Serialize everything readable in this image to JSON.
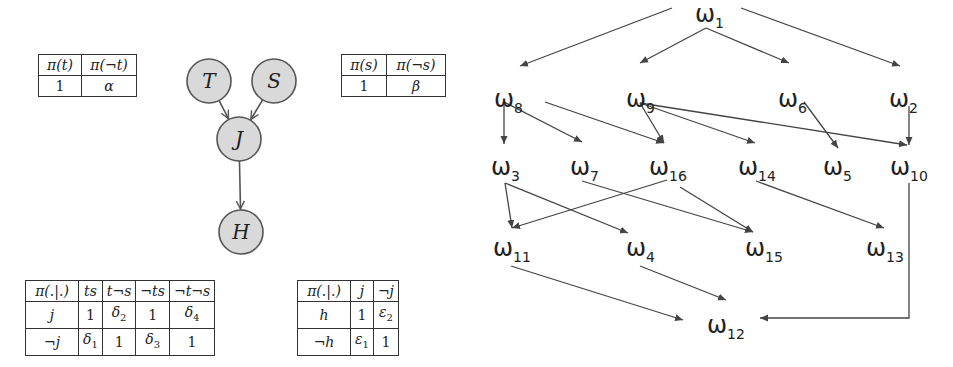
{
  "left_panel": {
    "network": {
      "nodes": [
        {
          "id": "T",
          "label": "T",
          "cx": 209,
          "cy": 81
        },
        {
          "id": "S",
          "label": "S",
          "cx": 274,
          "cy": 81
        },
        {
          "id": "J",
          "label": "J",
          "cx": 239,
          "cy": 139
        },
        {
          "id": "H",
          "label": "H",
          "cx": 241,
          "cy": 232
        }
      ],
      "edges": [
        {
          "from": "T",
          "to": "J"
        },
        {
          "from": "S",
          "to": "J"
        },
        {
          "from": "J",
          "to": "H"
        }
      ],
      "node_fill": "#d9d9d9",
      "node_stroke": "#555555"
    },
    "table_t": {
      "header": [
        "π(t)",
        "π(¬t)"
      ],
      "row": [
        "1",
        "α"
      ]
    },
    "table_s": {
      "header": [
        "π(s)",
        "π(¬s)"
      ],
      "row": [
        "1",
        "β"
      ]
    },
    "table_j": {
      "header": [
        "π(.|.)",
        "ts",
        "t¬s",
        "¬ts",
        "¬t¬s"
      ],
      "rows": [
        [
          "j",
          "1",
          "δ2",
          "1",
          "δ4"
        ],
        [
          "¬j",
          "δ1",
          "1",
          "δ3",
          "1"
        ]
      ]
    },
    "table_h": {
      "header": [
        "π(.|.)",
        "j",
        "¬j"
      ],
      "rows": [
        [
          "h",
          "1",
          "ε2"
        ],
        [
          "¬h",
          "ε1",
          "1"
        ]
      ]
    }
  },
  "right_panel": {
    "symbol": "ω",
    "nodes": [
      {
        "id": "1",
        "sub": "1",
        "x": 695,
        "y": 22
      },
      {
        "id": "8",
        "sub": "8",
        "x": 494,
        "y": 107
      },
      {
        "id": "9",
        "sub": "9",
        "x": 626,
        "y": 107
      },
      {
        "id": "6",
        "sub": "6",
        "x": 778,
        "y": 107
      },
      {
        "id": "2",
        "sub": "2",
        "x": 889,
        "y": 107
      },
      {
        "id": "3",
        "sub": "3",
        "x": 491,
        "y": 175
      },
      {
        "id": "7",
        "sub": "7",
        "x": 570,
        "y": 175
      },
      {
        "id": "16",
        "sub": "16",
        "x": 649,
        "y": 175
      },
      {
        "id": "14",
        "sub": "14",
        "x": 738,
        "y": 175
      },
      {
        "id": "5",
        "sub": "5",
        "x": 823,
        "y": 175
      },
      {
        "id": "10",
        "sub": "10",
        "x": 890,
        "y": 175
      },
      {
        "id": "11",
        "sub": "11",
        "x": 493,
        "y": 256
      },
      {
        "id": "4",
        "sub": "4",
        "x": 626,
        "y": 256
      },
      {
        "id": "15",
        "sub": "15",
        "x": 745,
        "y": 256
      },
      {
        "id": "13",
        "sub": "13",
        "x": 866,
        "y": 256
      },
      {
        "id": "12",
        "sub": "12",
        "x": 707,
        "y": 333
      }
    ],
    "edges": [
      {
        "from": "1",
        "to": "8",
        "points": [
          [
            672,
            8
          ],
          [
            520,
            66
          ]
        ]
      },
      {
        "from": "1",
        "to": "9",
        "points": [
          [
            706,
            28
          ],
          [
            640,
            63
          ]
        ]
      },
      {
        "from": "1",
        "to": "6",
        "points": [
          [
            706,
            28
          ],
          [
            789,
            63
          ]
        ]
      },
      {
        "from": "1",
        "to": "2",
        "points": [
          [
            741,
            8
          ],
          [
            900,
            66
          ]
        ]
      },
      {
        "from": "8",
        "to": "3",
        "points": [
          [
            504,
            102
          ],
          [
            504,
            144
          ]
        ]
      },
      {
        "from": "8",
        "to": "7",
        "points": [
          [
            504,
            102
          ],
          [
            582,
            142
          ]
        ]
      },
      {
        "from": "8",
        "to": "16",
        "points": [
          [
            545,
            102
          ],
          [
            664,
            143
          ]
        ]
      },
      {
        "from": "9",
        "to": "16",
        "points": [
          [
            640,
            103
          ],
          [
            664,
            143
          ]
        ]
      },
      {
        "from": "9",
        "to": "14",
        "points": [
          [
            640,
            103
          ],
          [
            755,
            143
          ]
        ]
      },
      {
        "from": "9",
        "to": "10",
        "points": [
          [
            640,
            103
          ],
          [
            907,
            145
          ]
        ]
      },
      {
        "from": "6",
        "to": "5",
        "points": [
          [
            804,
            102
          ],
          [
            838,
            148
          ]
        ]
      },
      {
        "from": "2",
        "to": "10",
        "points": [
          [
            909,
            106
          ],
          [
            909,
            145
          ]
        ]
      },
      {
        "from": "3",
        "to": "11",
        "points": [
          [
            505,
            183
          ],
          [
            512,
            228
          ]
        ]
      },
      {
        "from": "3",
        "to": "4",
        "points": [
          [
            505,
            183
          ],
          [
            628,
            233
          ]
        ]
      },
      {
        "from": "16",
        "to": "11",
        "points": [
          [
            667,
            180
          ],
          [
            512,
            228
          ]
        ]
      },
      {
        "from": "7",
        "to": "15",
        "points": [
          [
            582,
            181
          ],
          [
            753,
            232
          ]
        ]
      },
      {
        "from": "16",
        "to": "15",
        "points": [
          [
            680,
            187
          ],
          [
            753,
            232
          ]
        ]
      },
      {
        "from": "14",
        "to": "13",
        "points": [
          [
            756,
            181
          ],
          [
            884,
            228
          ]
        ]
      },
      {
        "from": "11",
        "to": "12",
        "points": [
          [
            511,
            266
          ],
          [
            683,
            320
          ]
        ]
      },
      {
        "from": "4",
        "to": "12",
        "points": [
          [
            640,
            266
          ],
          [
            726,
            300
          ]
        ]
      },
      {
        "from": "10",
        "to": "12",
        "points": [
          [
            909,
            183
          ],
          [
            909,
            318
          ],
          [
            760,
            318
          ]
        ]
      }
    ],
    "edge_color": "#444444"
  }
}
